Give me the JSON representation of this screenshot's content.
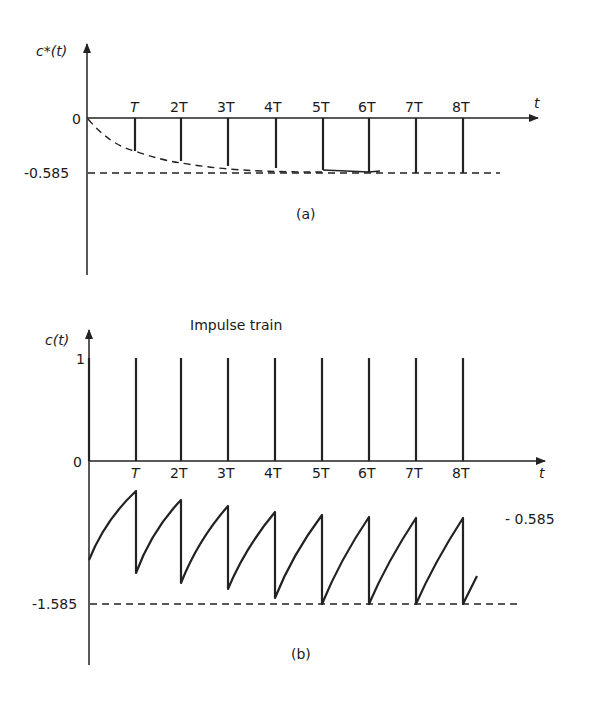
{
  "panel_a": {
    "y_label": "c*(t)",
    "x_label": "t",
    "zero_label": "0",
    "level_label": "-0.585",
    "caption": "(a)",
    "tick_labels": [
      "T",
      "2T",
      "3T",
      "4T",
      "5T",
      "6T",
      "7T",
      "8T"
    ],
    "impulse_values": [
      -0.37,
      -0.49,
      -0.55,
      -0.57,
      -0.58,
      -0.585,
      -0.585,
      -0.585
    ],
    "asymptote": -0.585
  },
  "panel_b": {
    "y_label": "c(t)",
    "x_label": "t",
    "title": "Impulse train",
    "one_label": "1",
    "zero_label": "0",
    "level_label": "-1.585",
    "upper_label": "- 0.585",
    "caption": "(b)",
    "tick_labels": [
      "T",
      "2T",
      "3T",
      "4T",
      "5T",
      "6T",
      "7T",
      "8T"
    ],
    "impulse_height": 1,
    "sawtooth": {
      "start": -1.0,
      "peaks": [
        -0.23,
        -0.37,
        -0.45,
        -0.5,
        -0.55,
        -0.57,
        -0.58,
        -0.585
      ],
      "troughs": [
        -1.23,
        -1.37,
        -1.45,
        -1.5,
        -1.585,
        -1.585,
        -1.585,
        -1.585
      ]
    },
    "lower_asymptote": -1.585
  }
}
